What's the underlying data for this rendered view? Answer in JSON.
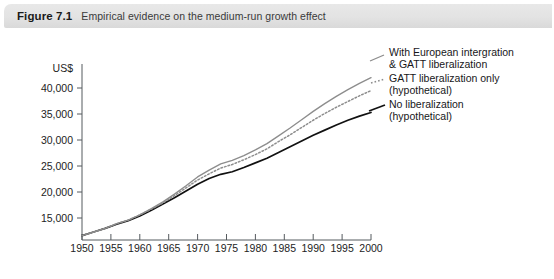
{
  "figure": {
    "number": "Figure 7.1",
    "caption": "Empirical evidence on the medium-run growth effect"
  },
  "chart_data": {
    "type": "line",
    "title": "Empirical evidence on the medium-run growth effect",
    "xlabel": "",
    "ylabel": "US$",
    "y_unit_label": "US$",
    "xlim": [
      1950,
      2000
    ],
    "ylim": [
      11000,
      42000
    ],
    "grid": false,
    "legend_position": "right",
    "x_ticks": [
      1950,
      1955,
      1960,
      1965,
      1970,
      1975,
      1980,
      1985,
      1990,
      1995,
      2000
    ],
    "x_tick_labels": [
      "1950",
      "1955",
      "1960",
      "1965",
      "1970",
      "1975",
      "1980",
      "1985",
      "1990",
      "1995",
      "2000"
    ],
    "y_ticks": [
      15000,
      20000,
      25000,
      30000,
      35000,
      40000
    ],
    "y_tick_labels": [
      "15,000",
      "20,000",
      "25,000",
      "30,000",
      "35,000",
      "40,000"
    ],
    "x": [
      1950,
      1952,
      1954,
      1956,
      1958,
      1960,
      1962,
      1964,
      1966,
      1968,
      1970,
      1972,
      1974,
      1976,
      1978,
      1980,
      1982,
      1984,
      1986,
      1988,
      1990,
      1992,
      1994,
      1996,
      1998,
      2000
    ],
    "series": [
      {
        "name": "With European intergration & GATT liberalization",
        "style": "solid",
        "color": "#8d8d8d",
        "values": [
          11600,
          12300,
          13000,
          13900,
          14600,
          15600,
          16800,
          18100,
          19600,
          21200,
          22900,
          24200,
          25400,
          26100,
          27000,
          28100,
          29300,
          30800,
          32300,
          33900,
          35500,
          37000,
          38400,
          39700,
          40900,
          42000
        ]
      },
      {
        "name": "GATT liberalization only (hypothetical)",
        "style": "dotted",
        "color": "#8d8d8d",
        "values": [
          11600,
          12300,
          13000,
          13900,
          14600,
          15600,
          16700,
          17900,
          19300,
          20800,
          22300,
          23500,
          24600,
          25300,
          26200,
          27200,
          28300,
          29700,
          31000,
          32400,
          33800,
          35100,
          36300,
          37400,
          38500,
          39500
        ]
      },
      {
        "name": "No liberalization (hypothetical)",
        "style": "solid",
        "color": "#111111",
        "values": [
          11600,
          12300,
          13000,
          13800,
          14500,
          15400,
          16500,
          17700,
          18900,
          20200,
          21500,
          22600,
          23400,
          23900,
          24700,
          25600,
          26500,
          27600,
          28700,
          29800,
          30900,
          31900,
          32900,
          33800,
          34600,
          35300
        ]
      }
    ]
  },
  "legend": [
    {
      "id": "legend-european-integration-gatt",
      "line1": "With European intergration",
      "line2": "& GATT liberalization",
      "style": "solid-gray"
    },
    {
      "id": "legend-gatt-only",
      "line1": "GATT liberalization only",
      "line2": "(hypothetical)",
      "style": "dotted-gray"
    },
    {
      "id": "legend-no-liberalization",
      "line1": "No liberalization",
      "line2": "(hypothetical)",
      "style": "solid-black"
    }
  ]
}
